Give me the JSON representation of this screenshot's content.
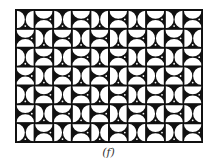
{
  "figure": {
    "caption": "(f)",
    "grid": {
      "cols": 10,
      "rows": 7
    },
    "colors": {
      "ink": "#111111",
      "paper": "#ffffff"
    },
    "tiles": [
      [
        "v",
        "h",
        "v",
        "h",
        "v",
        "h",
        "v",
        "h",
        "v",
        "h"
      ],
      [
        "h",
        "v",
        "h",
        "v",
        "h",
        "v",
        "h",
        "v",
        "h",
        "v"
      ],
      [
        "v",
        "h",
        "v",
        "h",
        "v",
        "h",
        "v",
        "h",
        "v",
        "h"
      ],
      [
        "h",
        "v",
        "h",
        "v",
        "h",
        "v",
        "h",
        "v",
        "h",
        "v"
      ],
      [
        "v",
        "h",
        "v",
        "h",
        "v",
        "h",
        "v",
        "h",
        "v",
        "h"
      ],
      [
        "h",
        "v",
        "h",
        "v",
        "h",
        "v",
        "h",
        "v",
        "h",
        "v"
      ],
      [
        "v",
        "h",
        "v",
        "h",
        "v",
        "h",
        "v",
        "h",
        "v",
        "h"
      ]
    ]
  }
}
